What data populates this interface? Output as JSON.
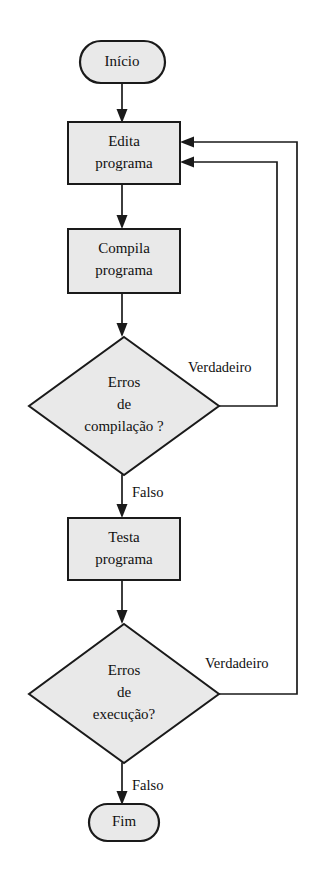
{
  "diagram": {
    "language": "pt-BR",
    "canvas": {
      "width": 313,
      "height": 887
    },
    "colors": {
      "background": "#ffffff",
      "node_fill": "#e9e9e9",
      "node_stroke": "#1a1a1a",
      "line": "#1a1a1a",
      "text": "#111111"
    }
  },
  "nodes": {
    "start": {
      "id": "inicio",
      "type": "terminator",
      "label": "Início",
      "cx": 122,
      "cy": 62,
      "rx": 43,
      "ry": 21
    },
    "edit": {
      "id": "edita-programa",
      "type": "process",
      "label_line1": "Edita",
      "label_line2": "programa",
      "x": 68,
      "y": 122,
      "w": 112,
      "h": 62
    },
    "compile": {
      "id": "compila-programa",
      "type": "process",
      "label_line1": "Compila",
      "label_line2": "programa",
      "x": 68,
      "y": 229,
      "w": 112,
      "h": 64
    },
    "decision_compile": {
      "id": "erros-de-compilacao",
      "type": "decision",
      "label_line1": "Erros",
      "label_line2": "de",
      "label_line3": "compilação ?",
      "cx": 124,
      "cy": 406,
      "rx": 95,
      "ry": 69
    },
    "test": {
      "id": "testa-programa",
      "type": "process",
      "label_line1": "Testa",
      "label_line2": "programa",
      "x": 68,
      "y": 518,
      "w": 112,
      "h": 62
    },
    "decision_exec": {
      "id": "erros-de-execucao",
      "type": "decision",
      "label_line1": "Erros",
      "label_line2": "de",
      "label_line3": "execução?",
      "cx": 124,
      "cy": 694,
      "rx": 95,
      "ry": 69
    },
    "end": {
      "id": "fim",
      "type": "terminator",
      "label": "Fim",
      "cx": 124,
      "cy": 822,
      "rx": 35,
      "ry": 18
    }
  },
  "edges": [
    {
      "id": "inicio-to-edita",
      "from": "inicio",
      "to": "edita-programa",
      "label": ""
    },
    {
      "id": "edita-to-compila",
      "from": "edita-programa",
      "to": "compila-programa",
      "label": ""
    },
    {
      "id": "compila-to-decisao-compilacao",
      "from": "compila-programa",
      "to": "erros-de-compilacao",
      "label": ""
    },
    {
      "id": "decisao-compilacao-verdadeiro",
      "from": "erros-de-compilacao",
      "to": "edita-programa",
      "label": "Verdadeiro",
      "label_x": 188,
      "label_y": 369
    },
    {
      "id": "decisao-compilacao-falso",
      "from": "erros-de-compilacao",
      "to": "testa-programa",
      "label": "Falso",
      "label_x": 132,
      "label_y": 494
    },
    {
      "id": "testa-to-decisao-execucao",
      "from": "testa-programa",
      "to": "erros-de-execucao",
      "label": ""
    },
    {
      "id": "decisao-execucao-verdadeiro",
      "from": "erros-de-execucao",
      "to": "edita-programa",
      "label": "Verdadeiro",
      "label_x": 205,
      "label_y": 665
    },
    {
      "id": "decisao-execucao-falso",
      "from": "erros-de-execucao",
      "to": "fim",
      "label": "Falso",
      "label_x": 132,
      "label_y": 787
    }
  ]
}
